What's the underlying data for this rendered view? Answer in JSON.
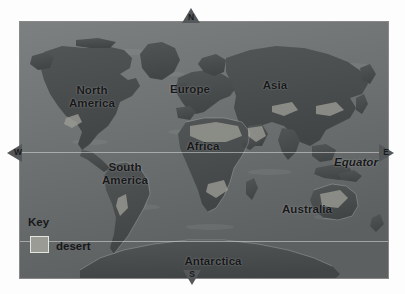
{
  "map": {
    "title": "World Map",
    "ocean_color": "#6f7273",
    "land_color": "#4a4d4e",
    "desert_color": "#9a9b94",
    "label_color": "#17181a",
    "gridline_color": "#e6e8e6",
    "continents": [
      {
        "id": "north-america",
        "label": "North\nAmerica"
      },
      {
        "id": "europe",
        "label": "Europe"
      },
      {
        "id": "asia",
        "label": "Asia"
      },
      {
        "id": "africa",
        "label": "Africa"
      },
      {
        "id": "south-america",
        "label": "South\nAmerica"
      },
      {
        "id": "australia",
        "label": "Australia"
      },
      {
        "id": "antarctica",
        "label": "Antarctica"
      }
    ],
    "equator_label": "Equator",
    "gridlines": [
      {
        "id": "equator",
        "label": "Equator"
      },
      {
        "id": "antarctic-circle",
        "label": ""
      }
    ]
  },
  "compass": {
    "north": "N",
    "south": "S",
    "west": "W",
    "east": "E"
  },
  "legend": {
    "title": "Key",
    "entries": [
      {
        "swatch_color": "#9a9b94",
        "label": "desert"
      }
    ],
    "desert_label": "desert"
  }
}
